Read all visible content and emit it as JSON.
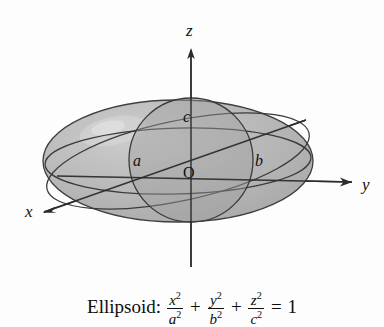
{
  "figure": {
    "axes": [
      {
        "id": "x",
        "label": "x",
        "icon": "axis-arrow-icon",
        "direction": "down-left"
      },
      {
        "id": "y",
        "label": "y",
        "icon": "axis-arrow-icon",
        "direction": "right"
      },
      {
        "id": "z",
        "label": "z",
        "icon": "axis-arrow-icon",
        "direction": "up"
      }
    ],
    "origin_label": "O",
    "semi_axes": [
      {
        "id": "a",
        "label": "a",
        "axis": "x"
      },
      {
        "id": "b",
        "label": "b",
        "axis": "y"
      },
      {
        "id": "c",
        "label": "c",
        "axis": "z"
      }
    ],
    "colors": {
      "surface_light": "#bdbdbd",
      "surface_mid": "#ababab",
      "surface_dark": "#9a9a9a",
      "highlight": "#d2d2d2",
      "outline": "#3a3a3a",
      "axis": "#2b2b2b",
      "background": "#fdfdfd",
      "text": "#111111"
    }
  },
  "caption": {
    "name": "Ellipsoid:",
    "equation": {
      "terms": [
        {
          "num_var": "x",
          "num_exp": "2",
          "den_var": "a",
          "den_exp": "2"
        },
        {
          "num_var": "y",
          "num_exp": "2",
          "den_var": "b",
          "den_exp": "2"
        },
        {
          "num_var": "z",
          "num_exp": "2",
          "den_var": "c",
          "den_exp": "2"
        }
      ],
      "plus": "+",
      "equals": "=",
      "rhs": "1"
    }
  }
}
